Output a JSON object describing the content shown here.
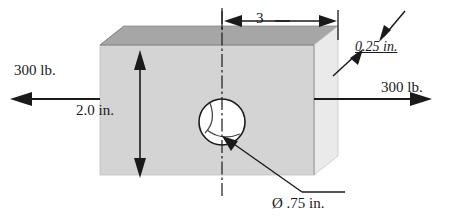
{
  "figure": {
    "colors": {
      "top_face": "#a6a6a6",
      "front_face": "#d4d4d4",
      "right_face": "#e8e8e8",
      "outline": "#2b2b2b",
      "line": "#1a1a1a",
      "hole_fill": "#ffffff",
      "background": "#ffffff"
    },
    "labels": {
      "force_left": "300 lb.",
      "force_right": "300 lb.",
      "height": "2.0 in.",
      "length": "3",
      "thickness": "0.25 in.",
      "hole_diameter": "Ø .75 in."
    },
    "icons": {
      "arrow_left": "arrow-left-icon",
      "arrow_right": "arrow-right-icon",
      "arrow_up": "arrow-up-icon",
      "arrow_down": "arrow-down-icon",
      "centerline": "centerline-icon",
      "leader": "leader-line-icon"
    }
  }
}
